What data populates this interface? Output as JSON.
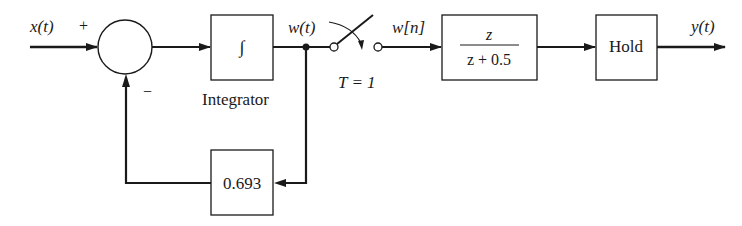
{
  "diagram": {
    "type": "block-diagram",
    "input_label": "x(t)",
    "summing_junction": {
      "plus_sign": "+",
      "minus_sign": "−"
    },
    "integrator": {
      "symbol": "∫",
      "caption": "Integrator"
    },
    "continuous_signal_label": "w(t)",
    "sampler": {
      "period_label": "T = 1"
    },
    "discrete_signal_label": "w[n]",
    "discrete_filter": {
      "numerator": "z",
      "denominator": "z + 0.5"
    },
    "hold": {
      "label": "Hold"
    },
    "output_label": "y(t)",
    "feedback_gain": {
      "label": "0.693"
    },
    "colors": {
      "stroke": "#1a1a1a",
      "background": "#ffffff"
    }
  }
}
